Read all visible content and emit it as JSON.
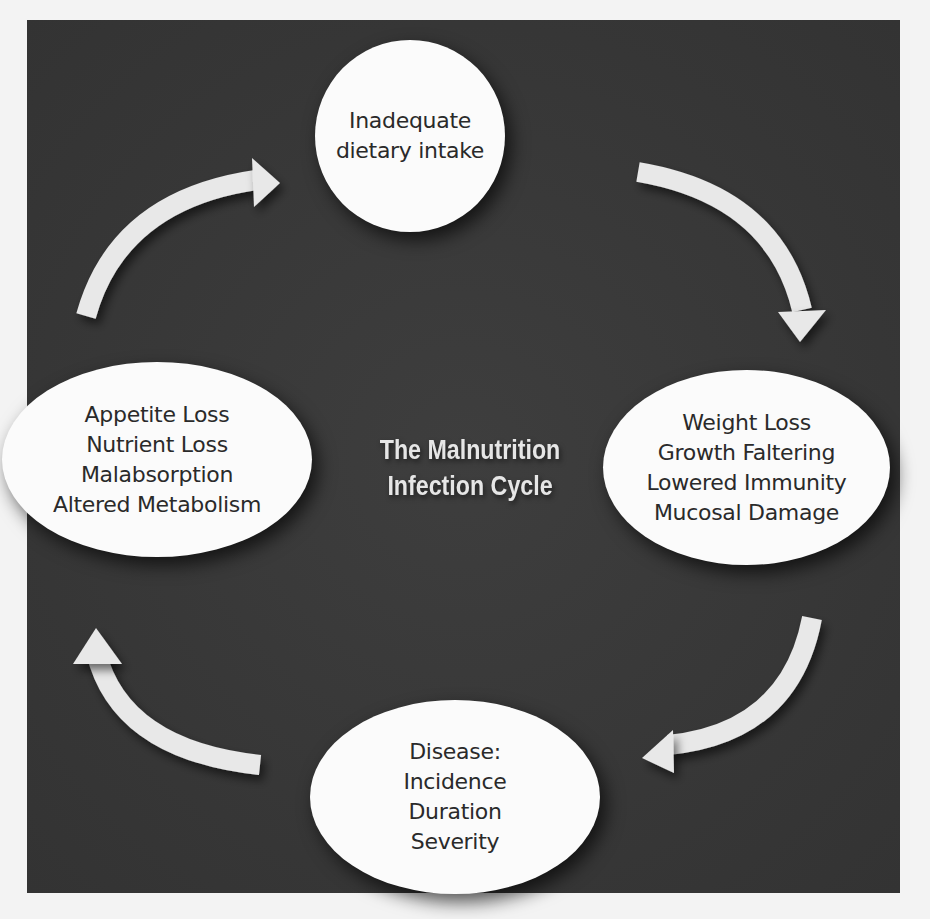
{
  "diagram": {
    "title_lines": [
      "The Malnutrition",
      "Infection Cycle"
    ],
    "colors": {
      "panel_background": "#3a3a3a",
      "node_fill": "#fbfbfb",
      "node_text": "#2a2a2a",
      "arrow_fill": "#e8e8e8",
      "title_text": "#e6e6e6",
      "page_background": "#f3f3f3"
    },
    "nodes": [
      {
        "id": "top",
        "lines": [
          "Inadequate",
          "dietary intake"
        ]
      },
      {
        "id": "right",
        "lines": [
          "Weight Loss",
          "Growth Faltering",
          "Lowered Immunity",
          "Mucosal Damage"
        ]
      },
      {
        "id": "bottom",
        "lines": [
          "Disease:",
          "Incidence",
          "Duration",
          "Severity"
        ]
      },
      {
        "id": "left",
        "lines": [
          "Appetite Loss",
          "Nutrient Loss",
          "Malabsorption",
          "Altered Metabolism"
        ]
      }
    ],
    "arrows": [
      {
        "from": "top",
        "to": "right",
        "direction": "clockwise"
      },
      {
        "from": "right",
        "to": "bottom",
        "direction": "clockwise"
      },
      {
        "from": "bottom",
        "to": "left",
        "direction": "clockwise"
      },
      {
        "from": "left",
        "to": "top",
        "direction": "clockwise"
      }
    ]
  }
}
